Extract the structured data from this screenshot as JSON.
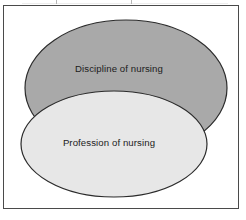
{
  "figure": {
    "type": "venn-overlap-diagram",
    "background_color": "#ffffff",
    "frame": {
      "name": "figure-border",
      "border_color": "#4a4a4a",
      "fill_color": "#ffffff"
    },
    "shapes": [
      {
        "id": "discipline",
        "label": "Discipline of nursing",
        "shape": "ellipse",
        "fill_color": "#a9a9a9",
        "stroke_color": "#2b2b2b",
        "cx": 126,
        "cy": 88,
        "rx": 101,
        "ry": 68,
        "label_x": 119,
        "label_y": 72,
        "z": 1
      },
      {
        "id": "profession",
        "label": "Profession of nursing",
        "shape": "ellipse",
        "fill_color": "#e7e7e7",
        "stroke_color": "#2b2b2b",
        "cx": 114,
        "cy": 144,
        "rx": 93,
        "ry": 53,
        "label_x": 109,
        "label_y": 146,
        "z": 2
      }
    ],
    "artifacts": {
      "scan_ticks": [
        {
          "name": "scan-tick-left",
          "x": 56
        },
        {
          "name": "scan-tick-right",
          "x": 131
        }
      ]
    }
  }
}
